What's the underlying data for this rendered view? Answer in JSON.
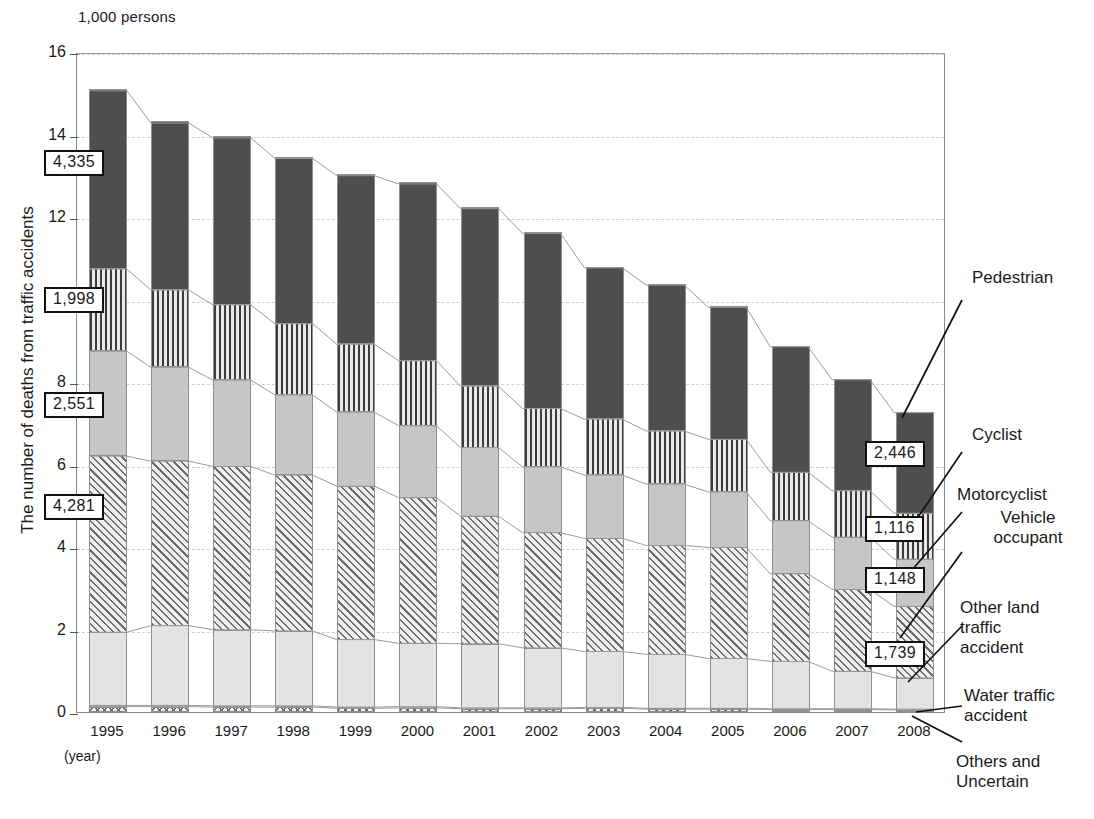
{
  "unit_label": "1,000 persons",
  "y_axis_title": "The number of deaths from traffic accidents",
  "x_axis_note": "(year)",
  "y_ticks": [
    "0",
    "2",
    "4",
    "6",
    "8",
    "10",
    "12",
    "14",
    "16"
  ],
  "series_labels": {
    "pedestrian": "Pedestrian",
    "cyclist": "Cyclist",
    "motorcyclist": "Motorcyclist",
    "vehicle_occupant": "Vehicle occupant",
    "other_land": "Other land traffic accident",
    "water": "Water traffic accident",
    "others": "Others and Uncertain"
  },
  "callouts": [
    {
      "id": "pedestrian-1995",
      "text": "4,335"
    },
    {
      "id": "cyclist-1995",
      "text": "1,998"
    },
    {
      "id": "motorcyclist-1995",
      "text": "2,551"
    },
    {
      "id": "vehicle-1995",
      "text": "4,281"
    },
    {
      "id": "pedestrian-2008",
      "text": "2,446"
    },
    {
      "id": "cyclist-2008",
      "text": "1,116"
    },
    {
      "id": "motorcyclist-2008",
      "text": "1,148"
    },
    {
      "id": "vehicle-2008",
      "text": "1,739"
    }
  ],
  "chart_data": {
    "type": "bar",
    "subtype": "stacked-vertical",
    "title": "",
    "unit": "1,000 persons",
    "xlabel": "(year)",
    "ylabel": "The number of deaths from traffic accidents",
    "ylim": [
      0,
      16
    ],
    "ytick_values": [
      0,
      2,
      4,
      6,
      8,
      10,
      12,
      14,
      16
    ],
    "grid": true,
    "legend_position": "right-callouts",
    "categories": [
      "1995",
      "1996",
      "1997",
      "1998",
      "1999",
      "2000",
      "2001",
      "2002",
      "2003",
      "2004",
      "2005",
      "2006",
      "2007",
      "2008"
    ],
    "stack_order_bottom_to_top": [
      "Others and Uncertain",
      "Water traffic accident",
      "Other land traffic accident",
      "Vehicle occupant",
      "Motorcyclist",
      "Cyclist",
      "Pedestrian"
    ],
    "series": [
      {
        "name": "Others and Uncertain",
        "pattern": "crosshatch",
        "values": [
          0.13,
          0.13,
          0.12,
          0.12,
          0.09,
          0.1,
          0.08,
          0.08,
          0.09,
          0.07,
          0.07,
          0.06,
          0.06,
          0.05
        ]
      },
      {
        "name": "Water traffic accident",
        "pattern": "solid-mid-gray",
        "values": [
          0.03,
          0.03,
          0.03,
          0.03,
          0.03,
          0.03,
          0.02,
          0.02,
          0.02,
          0.02,
          0.02,
          0.02,
          0.02,
          0.02
        ]
      },
      {
        "name": "Other land traffic accident",
        "pattern": "solid-very-light-gray",
        "values": [
          1.78,
          1.94,
          1.85,
          1.82,
          1.64,
          1.54,
          1.56,
          1.46,
          1.36,
          1.31,
          1.21,
          1.15,
          0.91,
          0.76
        ]
      },
      {
        "name": "Vehicle occupant",
        "pattern": "diagonal-hatch",
        "values": [
          4.281,
          4.0,
          3.97,
          3.79,
          3.73,
          3.54,
          3.1,
          2.8,
          2.75,
          2.65,
          2.7,
          2.13,
          1.99,
          1.739
        ]
      },
      {
        "name": "Motorcyclist",
        "pattern": "solid-light-gray",
        "values": [
          2.551,
          2.28,
          2.1,
          1.95,
          1.8,
          1.75,
          1.67,
          1.6,
          1.54,
          1.49,
          1.35,
          1.29,
          1.27,
          1.148
        ]
      },
      {
        "name": "Cyclist",
        "pattern": "vertical-stripes",
        "values": [
          1.998,
          1.88,
          1.83,
          1.73,
          1.65,
          1.58,
          1.49,
          1.42,
          1.36,
          1.29,
          1.28,
          1.18,
          1.13,
          1.116
        ]
      },
      {
        "name": "Pedestrian",
        "pattern": "solid-dark-gray",
        "values": [
          4.335,
          4.06,
          4.06,
          4.02,
          4.1,
          4.3,
          4.32,
          4.26,
          3.68,
          3.55,
          3.21,
          3.05,
          2.7,
          2.446
        ]
      }
    ],
    "totals": [
      15.1,
      14.29,
      13.96,
      13.46,
      13.04,
      12.84,
      12.24,
      11.64,
      10.8,
      10.38,
      9.84,
      8.88,
      8.09,
      7.28
    ],
    "annotated_values": {
      "1995": {
        "Pedestrian": 4335,
        "Cyclist": 1998,
        "Motorcyclist": 2551,
        "Vehicle occupant": 4281
      },
      "2008": {
        "Pedestrian": 2446,
        "Cyclist": 1116,
        "Motorcyclist": 1148,
        "Vehicle occupant": 1739
      }
    }
  }
}
